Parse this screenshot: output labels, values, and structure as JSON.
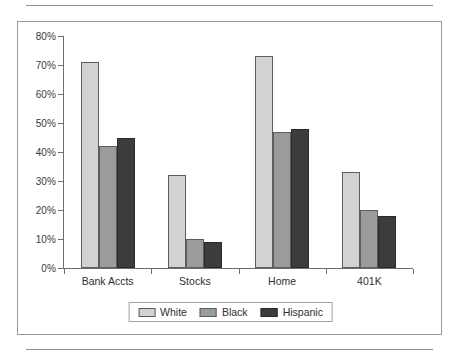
{
  "chart_data": {
    "type": "bar",
    "title": "",
    "subtitle": "",
    "xlabel": "",
    "ylabel": "",
    "categories": [
      "Bank Accts",
      "Stocks",
      "Home",
      "401K"
    ],
    "series": [
      {
        "name": "White",
        "color": "#d2d2d2",
        "values": [
          71,
          32,
          73,
          33
        ]
      },
      {
        "name": "Black",
        "color": "#9b9b9b",
        "values": [
          42,
          10,
          47,
          20
        ]
      },
      {
        "name": "Hispanic",
        "color": "#3c3c3c",
        "values": [
          45,
          9,
          48,
          18
        ]
      }
    ],
    "ylim": [
      0,
      80
    ],
    "ytick_values": [
      0,
      10,
      20,
      30,
      40,
      50,
      60,
      70,
      80
    ],
    "ytick_labels": [
      "0%",
      "10%",
      "20%",
      "30%",
      "40%",
      "50%",
      "60%",
      "70%",
      "80%"
    ],
    "grid": false,
    "legend_position": "bottom"
  },
  "legend": {
    "items": [
      {
        "label": "White"
      },
      {
        "label": "Black"
      },
      {
        "label": "Hispanic"
      }
    ]
  }
}
